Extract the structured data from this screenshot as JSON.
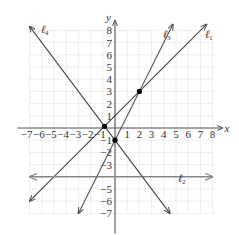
{
  "chart_data": {
    "type": "line",
    "title": "",
    "xlabel": "x",
    "ylabel": "y",
    "xlim": [
      -7,
      8
    ],
    "ylim": [
      -7,
      8
    ],
    "grid": true,
    "x_ticks": [
      -7,
      -6,
      -5,
      -4,
      -3,
      -2,
      -1,
      1,
      2,
      3,
      4,
      5,
      6,
      7,
      8
    ],
    "y_ticks": [
      -7,
      -6,
      -5,
      -3,
      -2,
      -1,
      1,
      2,
      3,
      4,
      5,
      6,
      7,
      8
    ],
    "series": [
      {
        "name": "ℓ1",
        "label_main": "ℓ",
        "label_sub": "1",
        "equation": "y = x + 1",
        "slope": 1,
        "intercept": 1,
        "x": [
          -7,
          7.5
        ],
        "y": [
          -6,
          8.5
        ],
        "color": "#444444"
      },
      {
        "name": "ℓ2",
        "label_main": "ℓ",
        "label_sub": "2",
        "equation": "y = -4",
        "slope": 0,
        "intercept": -4,
        "x": [
          -7,
          8
        ],
        "y": [
          -4,
          -4
        ],
        "color": "#888888"
      },
      {
        "name": "ℓ3",
        "label_main": "ℓ",
        "label_sub": "3",
        "equation": "y = 2x - 1",
        "slope": 2,
        "intercept": -1,
        "x": [
          -3,
          4.75
        ],
        "y": [
          -7,
          8.5
        ],
        "color": "#555555"
      },
      {
        "name": "ℓ4",
        "label_main": "ℓ",
        "label_sub": "4",
        "equation": "y = -4/3 x - 1",
        "slope": -1.3333,
        "intercept": -1,
        "x": [
          -7,
          4.5
        ],
        "y": [
          8.33,
          -7
        ],
        "color": "#444444"
      }
    ],
    "points": [
      {
        "x": 2,
        "y": 3,
        "label": "ℓ1 ∩ ℓ3"
      },
      {
        "x": 0,
        "y": -1,
        "label": "ℓ3 ∩ ℓ4"
      },
      {
        "x": -0.86,
        "y": 0.14,
        "label": "ℓ1 ∩ ℓ4"
      }
    ]
  }
}
